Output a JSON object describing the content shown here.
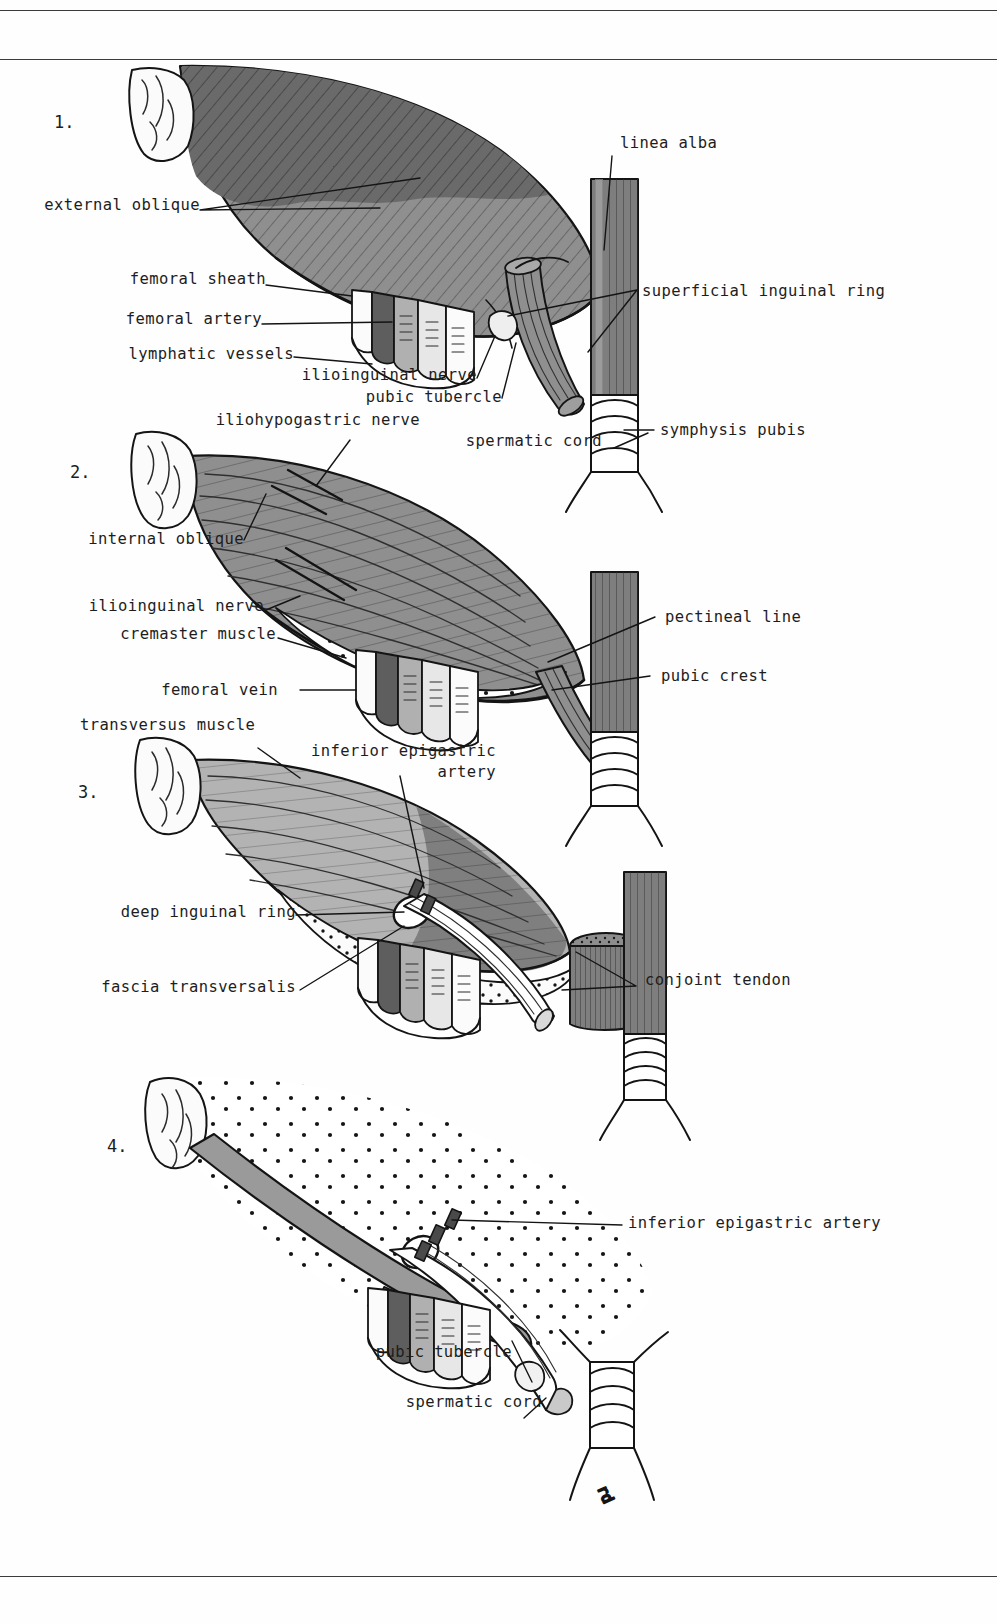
{
  "plate": {
    "width": 997,
    "height": 1624,
    "background": "#fefefe",
    "rule_color": "#3b3b3b",
    "artist_monogram": "rd"
  },
  "panels": [
    {
      "number": "1.",
      "title": "external oblique layer"
    },
    {
      "number": "2.",
      "title": "internal oblique layer"
    },
    {
      "number": "3.",
      "title": "transversus layer"
    },
    {
      "number": "4.",
      "title": "fascia transversalis layer"
    }
  ],
  "labels": {
    "panel1": [
      {
        "id": "external-oblique",
        "text": "external oblique",
        "align": "right"
      },
      {
        "id": "femoral-sheath",
        "text": "femoral sheath",
        "align": "right"
      },
      {
        "id": "femoral-artery",
        "text": "femoral artery",
        "align": "right"
      },
      {
        "id": "lymphatic-vessels",
        "text": "lymphatic vessels",
        "align": "right"
      },
      {
        "id": "ilioinguinal-nerve",
        "text": "ilioinguinal nerve",
        "align": "right"
      },
      {
        "id": "pubic-tubercle",
        "text": "pubic tubercle",
        "align": "right"
      },
      {
        "id": "spermatic-cord",
        "text": "spermatic cord",
        "align": "right"
      },
      {
        "id": "linea-alba",
        "text": "linea alba",
        "align": "left"
      },
      {
        "id": "superficial-inguinal-ring",
        "text": "superficial inguinal ring",
        "align": "left"
      },
      {
        "id": "symphysis-pubis",
        "text": "symphysis pubis",
        "align": "left"
      }
    ],
    "panel2": [
      {
        "id": "iliohypogastric-nerve",
        "text": "iliohypogastric nerve",
        "align": "right"
      },
      {
        "id": "internal-oblique",
        "text": "internal oblique",
        "align": "right"
      },
      {
        "id": "ilioinguinal-nerve-2",
        "text": "ilioinguinal nerve",
        "align": "right"
      },
      {
        "id": "cremaster-muscle",
        "text": "cremaster muscle",
        "align": "right"
      },
      {
        "id": "femoral-vein",
        "text": "femoral vein",
        "align": "right"
      },
      {
        "id": "pectineal-line",
        "text": "pectineal line",
        "align": "left"
      },
      {
        "id": "pubic-crest",
        "text": "pubic crest",
        "align": "left"
      }
    ],
    "panel3": [
      {
        "id": "transversus-muscle",
        "text": "transversus muscle",
        "align": "left"
      },
      {
        "id": "inferior-epigastric-artery-l1",
        "text": "inferior epigastric",
        "align": "right"
      },
      {
        "id": "inferior-epigastric-artery-l2",
        "text": "artery",
        "align": "right"
      },
      {
        "id": "deep-inguinal-ring",
        "text": "deep inguinal ring",
        "align": "right"
      },
      {
        "id": "fascia-transversalis",
        "text": "fascia transversalis",
        "align": "right"
      },
      {
        "id": "conjoint-tendon",
        "text": "conjoint tendon",
        "align": "left"
      }
    ],
    "panel4": [
      {
        "id": "inferior-epigastric-artery-4",
        "text": "inferior epigastric artery",
        "align": "left"
      },
      {
        "id": "pubic-tubercle-4",
        "text": "pubic tubercle",
        "align": "right"
      },
      {
        "id": "spermatic-cord-4",
        "text": "spermatic cord",
        "align": "right"
      }
    ]
  },
  "palette": {
    "ink": "#1d1d1d",
    "outline": "#141414",
    "muscle_dark": "#6a6a6a",
    "muscle_mid": "#8f8f8f",
    "muscle_light": "#b3b3b3",
    "muscle_pale": "#c9c9c9",
    "bone_white": "#fbfbfb",
    "fascia_dot_fill": "#fafafa",
    "vessel_dark": "#5e5e5e",
    "vessel_mid": "#9a9a9a",
    "rule": "#3b3b3b"
  }
}
